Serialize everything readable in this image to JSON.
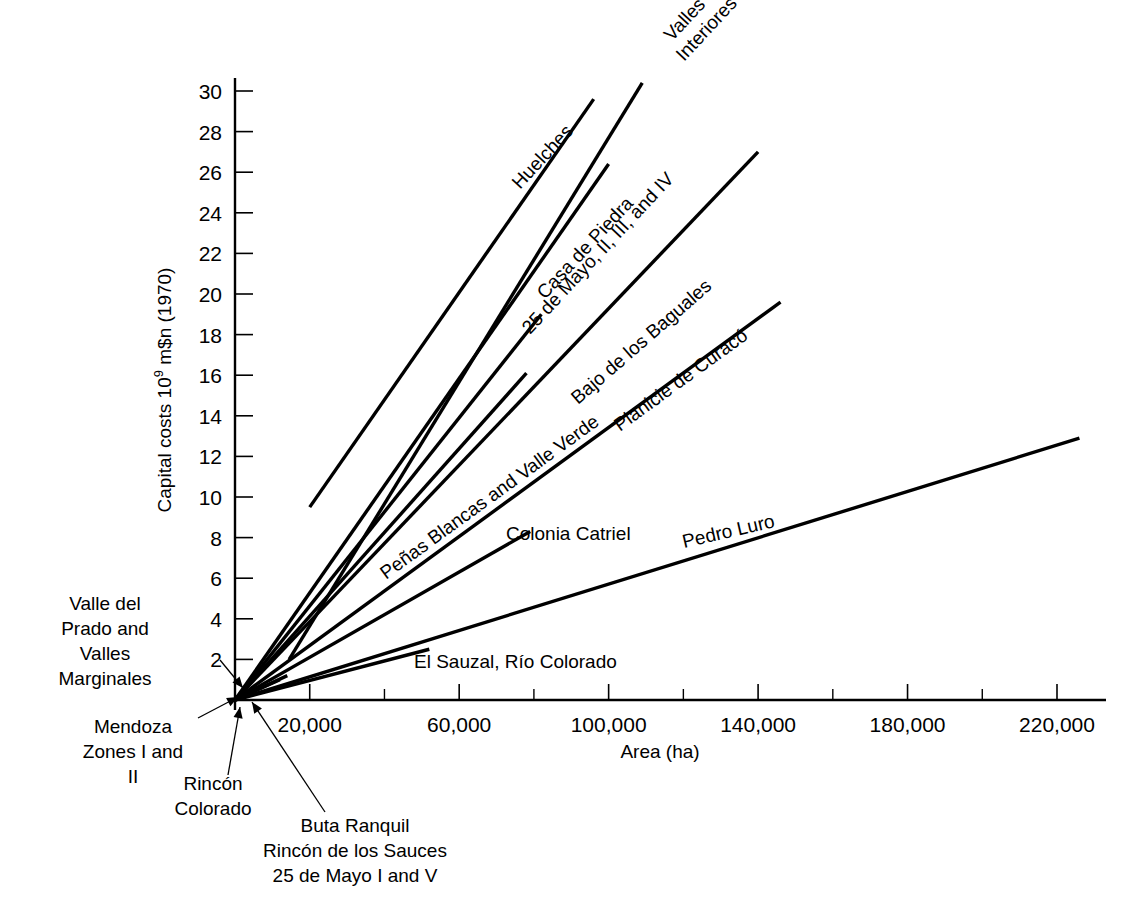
{
  "chart_data": {
    "type": "line",
    "title": "",
    "xlabel": "Area (ha)",
    "ylabel_parts": {
      "pre": "Capital costs 10",
      "sup": "9",
      "post": " m$n (1970)"
    },
    "ylabel": "Capital costs 10^9 m$n (1970)",
    "xlim": [
      0,
      232000
    ],
    "ylim": [
      0,
      31
    ],
    "grid": false,
    "legend_position": "inline-labels",
    "x_ticks_major": [
      "20,000",
      "60,000",
      "100,000",
      "140,000",
      "180,000",
      "220,000"
    ],
    "x_tick_values_major": [
      20000,
      60000,
      100000,
      140000,
      180000,
      220000
    ],
    "x_tick_values_minor": [
      40000,
      80000,
      120000,
      160000,
      200000
    ],
    "y_ticks": [
      "2",
      "4",
      "6",
      "8",
      "10",
      "12",
      "14",
      "16",
      "18",
      "20",
      "22",
      "24",
      "26",
      "28",
      "30"
    ],
    "y_tick_values": [
      2,
      4,
      6,
      8,
      10,
      12,
      14,
      16,
      18,
      20,
      22,
      24,
      26,
      28,
      30
    ],
    "series": [
      {
        "name": "Huelches",
        "x": [
          0,
          12000,
          37000,
          96000
        ],
        "y": [
          0,
          1.0,
          9.5,
          29.6
        ],
        "segments": [
          [
            0,
            0,
            12000,
            1.0
          ],
          [
            20000,
            9.5,
            96000,
            29.6
          ]
        ]
      },
      {
        "name": "Valles Interiores",
        "x": [
          0,
          14000,
          99000
        ],
        "y": [
          0,
          1.2,
          30.4
        ],
        "segments": [
          [
            0,
            0,
            14000,
            1.2
          ],
          [
            14500,
            2.0,
            109000,
            30.4
          ]
        ]
      },
      {
        "name": "Casa de Piedra",
        "x": [
          0,
          100000
        ],
        "y": [
          0,
          26.4
        ],
        "segments": [
          [
            0,
            0,
            100000,
            26.4
          ]
        ]
      },
      {
        "name": "25 de Mayo, II, III, and IV",
        "x": [
          0,
          82000
        ],
        "y": [
          0,
          19.0
        ],
        "segments": [
          [
            0,
            0,
            82000,
            19.0
          ]
        ]
      },
      {
        "name": "Bajo de los Baguales",
        "x": [
          0,
          140000
        ],
        "y": [
          0,
          27.0
        ],
        "segments": [
          [
            0,
            0,
            140000,
            27.0
          ]
        ]
      },
      {
        "name": "Peñas Blancas and Valle Verde",
        "x": [
          0,
          78000
        ],
        "y": [
          0,
          16.1
        ],
        "segments": [
          [
            0,
            0,
            78000,
            16.1
          ]
        ]
      },
      {
        "name": "Planicie de Curacó",
        "x": [
          0,
          146000
        ],
        "y": [
          0,
          19.6
        ],
        "segments": [
          [
            0,
            0,
            146000,
            19.6
          ]
        ]
      },
      {
        "name": "Colonia Catriel",
        "x": [
          0,
          79000
        ],
        "y": [
          0,
          8.3
        ],
        "segments": [
          [
            0,
            0,
            79000,
            8.3
          ]
        ]
      },
      {
        "name": "Pedro Luro",
        "x": [
          0,
          226000
        ],
        "y": [
          0,
          12.9
        ],
        "segments": [
          [
            0,
            0,
            226000,
            12.9
          ]
        ]
      },
      {
        "name": "El Sauzal, Río Colorado",
        "x": [
          0,
          52000
        ],
        "y": [
          0,
          2.5
        ],
        "segments": [
          [
            0,
            0,
            52000,
            2.5
          ]
        ]
      }
    ],
    "inline_labels": [
      {
        "text": "Huelches",
        "x": 520,
        "y": 190,
        "rotate": -47
      },
      {
        "text": "Valles",
        "x": 672,
        "y": 42,
        "rotate": -47
      },
      {
        "text": "Interiores",
        "x": 684,
        "y": 62,
        "rotate": -47
      },
      {
        "text": "Casa de Piedra",
        "x": 545,
        "y": 300,
        "rotate": -47
      },
      {
        "text": "25 de Mayo, II, III, and IV",
        "x": 530,
        "y": 335,
        "rotate": -47
      },
      {
        "text": "Bajo de los Baguales",
        "x": 578,
        "y": 405,
        "rotate": -41
      },
      {
        "text": "Peñas Blancas and Valle Verde",
        "x": 386,
        "y": 580,
        "rotate": -36
      },
      {
        "text": "Planicie de Curacó",
        "x": 620,
        "y": 432,
        "rotate": -36
      },
      {
        "text": "Colonia Catriel",
        "x": 506,
        "y": 540,
        "rotate": 0
      },
      {
        "text": "Pedro Luro",
        "x": 684,
        "y": 548,
        "rotate": -13
      },
      {
        "text": "El Sauzal, Río Colorado",
        "x": 414,
        "y": 668,
        "rotate": 0
      }
    ],
    "leader_annotations": [
      {
        "id": "valle-del-prado",
        "lines": [
          "Valle del",
          "Prado and",
          "Valles",
          "Marginales"
        ],
        "align": "center",
        "text_x": 105,
        "text_y": 610,
        "arrow": [
          [
            220,
            660
          ],
          [
            243,
            688
          ]
        ]
      },
      {
        "id": "mendoza-zones",
        "lines": [
          "Mendoza",
          "Zones I and",
          "II"
        ],
        "align": "center",
        "text_x": 133,
        "text_y": 733,
        "arrow": [
          [
            198,
            718
          ],
          [
            238,
            697
          ]
        ]
      },
      {
        "id": "rincon-colorado",
        "lines": [
          "Rincón",
          "Colorado"
        ],
        "align": "center",
        "text_x": 213,
        "text_y": 790,
        "arrow": [
          [
            228,
            775
          ],
          [
            240,
            707
          ]
        ]
      },
      {
        "id": "buta-ranquil",
        "lines": [
          "Buta Ranquil",
          "Rincón de los Sauces",
          "25 de Mayo I and V"
        ],
        "align": "center",
        "text_x": 355,
        "text_y": 832,
        "arrow": [
          [
            325,
            812
          ],
          [
            252,
            702
          ]
        ]
      }
    ]
  },
  "axes": {
    "x_axis_label": "Area (ha)",
    "y_axis_label_pre": "Capital costs 10",
    "y_axis_label_sup": "9",
    "y_axis_label_post": " m$n (1970)"
  },
  "style": {
    "line_color": "#000000",
    "background": "#ffffff"
  }
}
